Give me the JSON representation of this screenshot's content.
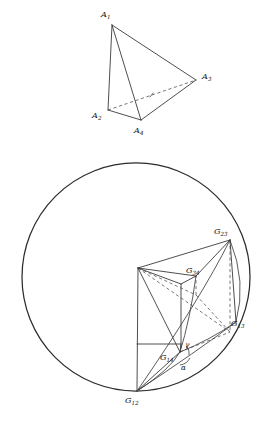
{
  "figure": {
    "background_color": "#ffffff",
    "ink_color": "#2b2b2b",
    "panels": [
      {
        "id": "tetrahedron",
        "caption": ""
      },
      {
        "id": "gram-sphere",
        "caption": ""
      }
    ]
  },
  "tetrahedron": {
    "vertices": [
      {
        "name": "A1",
        "base": "A",
        "sub": "1",
        "x": 112,
        "y": 25,
        "label_x": 101,
        "label_y": 17
      },
      {
        "name": "A2",
        "base": "A",
        "sub": "2",
        "x": 108,
        "y": 110,
        "label_x": 93,
        "label_y": 118
      },
      {
        "name": "A3",
        "base": "A",
        "sub": "3",
        "x": 196,
        "y": 80,
        "label_x": 202,
        "label_y": 79
      },
      {
        "name": "A4",
        "base": "A",
        "sub": "4",
        "x": 141,
        "y": 120,
        "label_x": 135,
        "label_y": 133
      }
    ],
    "edges_visible": [
      {
        "from": "A1",
        "to": "A2"
      },
      {
        "from": "A1",
        "to": "A3"
      },
      {
        "from": "A1",
        "to": "A4"
      },
      {
        "from": "A2",
        "to": "A4"
      },
      {
        "from": "A3",
        "to": "A4"
      }
    ],
    "edges_hidden": [
      {
        "from": "A2",
        "to": "A3"
      }
    ]
  },
  "gram_sphere": {
    "circle": {
      "cx": 136,
      "cy": 277,
      "r": 114
    },
    "points": [
      {
        "name": "G12",
        "base": "G",
        "sub": "12",
        "x": 137,
        "y": 391,
        "label_x": 126,
        "label_y": 402
      },
      {
        "name": "G13",
        "base": "G",
        "sub": "13",
        "x": 228,
        "y": 322,
        "label_x": 231,
        "label_y": 325
      },
      {
        "name": "G14",
        "base": "G",
        "sub": "14",
        "x": 180,
        "y": 352,
        "label_x": 161,
        "label_y": 360
      },
      {
        "name": "G23",
        "base": "G",
        "sub": "23",
        "x": 230,
        "y": 240,
        "label_x": 215,
        "label_y": 233
      },
      {
        "name": "G34",
        "base": "G",
        "sub": "34",
        "x": 196,
        "y": 276,
        "label_x": 187,
        "label_y": 272
      },
      {
        "name": "apex",
        "base": "",
        "sub": "",
        "x": 138,
        "y": 268,
        "label_x": 0,
        "label_y": 0
      }
    ],
    "angles": [
      {
        "name": "alpha",
        "glyph": "α",
        "x": 183,
        "y": 368,
        "arc_cx": 180,
        "arc_cy": 352,
        "arc_r": 13
      },
      {
        "name": "gamma",
        "glyph": "γ",
        "x": 186,
        "y": 346,
        "arc_cx": 180,
        "arc_cy": 352,
        "arc_r": 9
      }
    ]
  }
}
